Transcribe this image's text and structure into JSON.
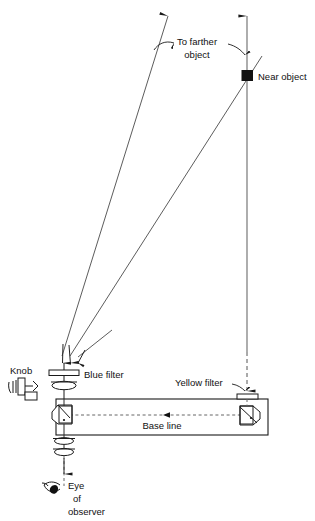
{
  "figure": {
    "type": "optical-ray-diagram",
    "background_color": "#ffffff",
    "ink_color": "#111111"
  },
  "labels": {
    "to_farther_object_line1": "To farther",
    "to_farther_object_line2": "object",
    "near_object": "Near object",
    "knob": "Knob",
    "blue_filter": "Blue filter",
    "yellow_filter": "Yellow filter",
    "base_line": "Base line",
    "eye_line1": "Eye",
    "eye_line2": "of",
    "eye_line3": "observer"
  },
  "elements": {
    "near_object_marker": "filled-square",
    "left_prism": "pentagon-prism",
    "right_prism": "pentagon-prism",
    "objective_lens": "biconvex-lens",
    "eyepiece_lens": "biconvex-lens",
    "blue_filter_plate": "flat-rectangular-filter",
    "yellow_filter_plate": "flat-rectangular-filter",
    "knob_handle": "crank-knob",
    "eye_symbol": "eye-profile"
  },
  "colors": {
    "ray": "#4a4a4a",
    "axis": "#6b6b6b",
    "optic_outline": "#1a1a1a",
    "dashed": "#555555",
    "near_object_fill": "#111111"
  }
}
